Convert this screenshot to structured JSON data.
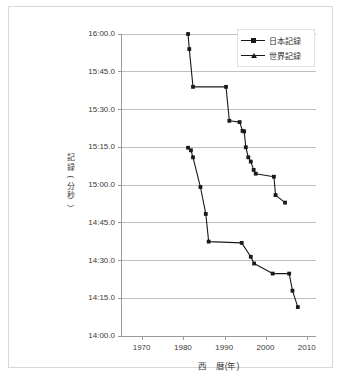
{
  "chart_data": {
    "type": "line",
    "title": "",
    "xlabel": "西　暦(年)",
    "ylabel": "記　録(分秒)",
    "xlim": [
      1965,
      2012
    ],
    "ylim_seconds": [
      840,
      960
    ],
    "grid": true,
    "legend_position": "top-right",
    "x_ticks": [
      "1970",
      "1980",
      "1990",
      "2000",
      "2010"
    ],
    "x_tick_values": [
      1970,
      1980,
      1990,
      2000,
      2010
    ],
    "y_ticks": [
      "14:00.0",
      "14:15.0",
      "14:30.0",
      "14:45.0",
      "15:00.0",
      "15:15.0",
      "15:30.0",
      "15:45.0",
      "16:00.0"
    ],
    "y_tick_values": [
      840,
      855,
      870,
      885,
      900,
      915,
      930,
      945,
      960
    ],
    "series": [
      {
        "name": "日本記録",
        "marker": "square",
        "color": "#1a1a1a",
        "x": [
          1981.0,
          1981.7,
          1982.2,
          1984.0,
          1985.3,
          1986.0,
          1994.0,
          1996.2,
          1997.0,
          2001.5,
          2005.5,
          2006.3,
          2007.6
        ],
        "y_seconds": [
          914.8,
          913.8,
          911.0,
          899.2,
          888.5,
          877.5,
          877.0,
          871.5,
          868.8,
          864.8,
          864.8,
          858.0,
          851.5
        ],
        "y_labels": [
          "15:14.8",
          "15:13.8",
          "15:11.0",
          "14:59.2",
          "14:48.5",
          "14:37.5",
          "14:37.0",
          "14:31.5",
          "14:28.8",
          "14:24.8",
          "14:24.8",
          "14:18.0",
          "14:11.5"
        ]
      },
      {
        "name": "世界記録",
        "marker": "square",
        "color": "#1a1a1a",
        "x": [
          1981.0,
          1981.3,
          1982.2,
          1990.2,
          1991.0,
          1993.5,
          1994.2,
          1994.6,
          1995.0,
          1995.6,
          1996.2,
          1996.9,
          1997.4,
          2001.8,
          2002.2,
          2004.5
        ],
        "y_seconds": [
          960.0,
          954.0,
          939.0,
          939.0,
          925.5,
          925.0,
          921.5,
          921.3,
          915.0,
          911.0,
          909.3,
          906.0,
          904.5,
          903.3,
          896.0,
          893.0
        ],
        "y_labels": [
          "16:00.0",
          "15:54.0",
          "15:39.0",
          "15:39.0",
          "15:25.5",
          "15:25.0",
          "15:21.5",
          "15:21.3",
          "15:15.0",
          "15:11.0",
          "15:09.3",
          "15:06.0",
          "15:04.5",
          "15:03.3",
          "14:56.0",
          "14:53.0"
        ]
      }
    ]
  },
  "legend": {
    "items": [
      {
        "label": "日本記録"
      },
      {
        "label": "世界記録"
      }
    ]
  },
  "axes": {
    "y_title_chars": [
      "記",
      "録",
      "(",
      "分",
      "秒",
      ")"
    ],
    "x_title": "西　暦(年)"
  }
}
